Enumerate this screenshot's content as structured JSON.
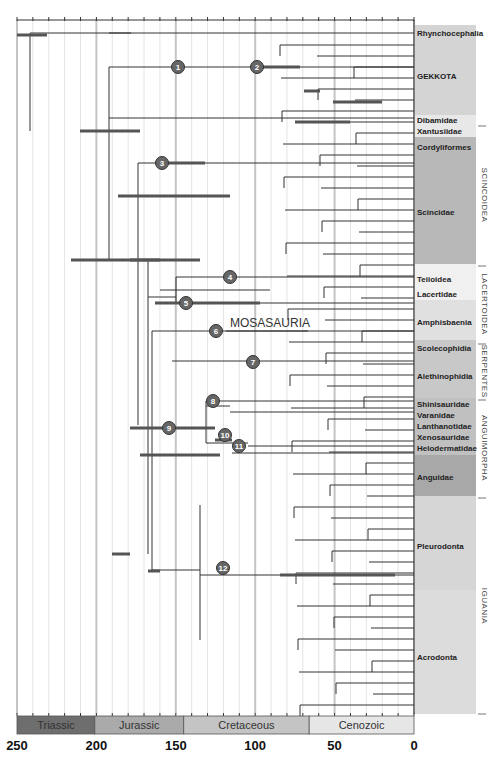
{
  "figure": {
    "axis": {
      "min": 0,
      "max": 250,
      "ticks": [
        250,
        200,
        150,
        100,
        50,
        0
      ],
      "x_at_250": 17,
      "x_at_0": 414
    },
    "periods": [
      {
        "name": "Triassic",
        "start": 250,
        "end": 201,
        "color": "#6e6e6e"
      },
      {
        "name": "Jurassic",
        "start": 201,
        "end": 145,
        "color": "#aaaaaa"
      },
      {
        "name": "Cretaceous",
        "start": 145,
        "end": 66,
        "color": "#c4c4c4"
      },
      {
        "name": "Cenozoic",
        "start": 66,
        "end": 0,
        "color": "#e6e6e6"
      }
    ],
    "tip_labels": [
      {
        "text": "Rhynchocephalia",
        "y": 33
      },
      {
        "text": "GEKKOTA",
        "y": 76
      },
      {
        "text": "Dibamidae",
        "y": 120
      },
      {
        "text": "Xantusiidae",
        "y": 131
      },
      {
        "text": "Cordyliformes",
        "y": 147
      },
      {
        "text": "Scincidae",
        "y": 212
      },
      {
        "text": "Teiioidea",
        "y": 279
      },
      {
        "text": "Lacertidae",
        "y": 294
      },
      {
        "text": "Amphisbaenia",
        "y": 322
      },
      {
        "text": "Scolecophidia",
        "y": 348
      },
      {
        "text": "Alethinophidia",
        "y": 376
      },
      {
        "text": "Shinisauridae",
        "y": 404
      },
      {
        "text": "Varanidae",
        "y": 415
      },
      {
        "text": "Lanthanotidae",
        "y": 426
      },
      {
        "text": "Xenosauridae",
        "y": 437
      },
      {
        "text": "Helodermatidae",
        "y": 448
      },
      {
        "text": "Anguidae",
        "y": 477
      },
      {
        "text": "Pleurodonta",
        "y": 546
      },
      {
        "text": "Acrodonta",
        "y": 657
      }
    ],
    "group_labels": [
      {
        "text": "SCINCOIDEA",
        "y1": 126,
        "y2": 264
      },
      {
        "text": "LACERTOIDEA",
        "y1": 266,
        "y2": 342
      },
      {
        "text": "SERPENTES",
        "y1": 344,
        "y2": 398
      },
      {
        "text": "ANGUIMORPHA",
        "y1": 400,
        "y2": 496
      },
      {
        "text": "IGUANIA",
        "y1": 498,
        "y2": 714
      }
    ],
    "bands": [
      {
        "y1": 25,
        "y2": 115,
        "color": "#d4d4d4"
      },
      {
        "y1": 115,
        "y2": 137,
        "color": "#e8e8e8"
      },
      {
        "y1": 137,
        "y2": 264,
        "color": "#b8b8b8"
      },
      {
        "y1": 264,
        "y2": 300,
        "color": "#f0f0f0"
      },
      {
        "y1": 300,
        "y2": 340,
        "color": "#e0e0e0"
      },
      {
        "y1": 340,
        "y2": 398,
        "color": "#c8c8c8"
      },
      {
        "y1": 398,
        "y2": 455,
        "color": "#c0c0c0"
      },
      {
        "y1": 455,
        "y2": 496,
        "color": "#a8a8a8"
      },
      {
        "y1": 496,
        "y2": 590,
        "color": "#d6d6d6"
      },
      {
        "y1": 590,
        "y2": 714,
        "color": "#dcdcdc"
      }
    ],
    "annotation": {
      "text": "MOSASAURIA",
      "x": 230,
      "y": 327
    },
    "node_markers": [
      {
        "n": "1",
        "x": 178,
        "y": 67
      },
      {
        "n": "2",
        "x": 257,
        "y": 67
      },
      {
        "n": "3",
        "x": 162,
        "y": 163
      },
      {
        "n": "4",
        "x": 230,
        "y": 277
      },
      {
        "n": "5",
        "x": 186,
        "y": 303
      },
      {
        "n": "6",
        "x": 216,
        "y": 331
      },
      {
        "n": "7",
        "x": 253,
        "y": 362
      },
      {
        "n": "8",
        "x": 213,
        "y": 401
      },
      {
        "n": "9",
        "x": 169,
        "y": 428
      },
      {
        "n": "10",
        "x": 225,
        "y": 435
      },
      {
        "n": "11",
        "x": 239,
        "y": 446
      },
      {
        "n": "12",
        "x": 223,
        "y": 568
      }
    ],
    "branches_h": [
      [
        33,
        30,
        414
      ],
      [
        33,
        131,
        109
      ],
      [
        67,
        109,
        414
      ],
      [
        118,
        109,
        414
      ],
      [
        163,
        138,
        200
      ],
      [
        163,
        200,
        414
      ],
      [
        260,
        109,
        148
      ],
      [
        297,
        148,
        176
      ],
      [
        277,
        176,
        414
      ],
      [
        303,
        176,
        414
      ],
      [
        290,
        160,
        270
      ],
      [
        331,
        152,
        414
      ],
      [
        361,
        172,
        414
      ],
      [
        428,
        152,
        206
      ],
      [
        570,
        152,
        200
      ],
      [
        575,
        200,
        414
      ],
      [
        401,
        206,
        414
      ],
      [
        406,
        206,
        230
      ],
      [
        412,
        230,
        414
      ],
      [
        443,
        206,
        248
      ],
      [
        446,
        248,
        414
      ],
      [
        453,
        232,
        414
      ]
    ],
    "branches_v": [
      [
        30,
        33,
        131
      ],
      [
        109,
        67,
        260
      ],
      [
        138,
        163,
        425
      ],
      [
        148,
        260,
        554
      ],
      [
        176,
        277,
        303
      ],
      [
        152,
        331,
        570
      ],
      [
        206,
        401,
        443
      ],
      [
        200,
        505,
        640
      ]
    ],
    "ci_bars": [
      [
        17,
        35,
        47
      ],
      [
        80,
        131,
        140
      ],
      [
        71,
        260,
        160
      ],
      [
        118,
        196,
        230
      ],
      [
        205,
        163,
        155
      ],
      [
        155,
        303,
        260
      ],
      [
        130,
        260,
        200
      ],
      [
        280,
        575,
        395
      ],
      [
        232,
        440,
        215
      ],
      [
        112,
        554,
        130
      ],
      [
        148,
        571,
        160
      ],
      [
        262,
        67,
        300
      ],
      [
        304,
        91,
        320
      ],
      [
        333,
        102,
        382
      ],
      [
        295,
        122,
        350
      ],
      [
        140,
        455,
        220
      ],
      [
        130,
        428,
        215
      ]
    ]
  }
}
